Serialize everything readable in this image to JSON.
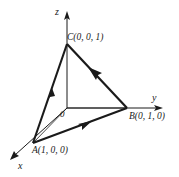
{
  "figure": {
    "stroke_color": "#1a1a1a",
    "background_color": "#ffffff",
    "axes": [
      {
        "name": "z",
        "label": "z",
        "from": [
          67,
          108
        ],
        "to": [
          67,
          14
        ],
        "arrow": "up"
      },
      {
        "name": "y",
        "label": "y",
        "from": [
          67,
          108
        ],
        "to": [
          162,
          108
        ],
        "arrow": "right"
      },
      {
        "name": "x",
        "label": "x",
        "from": [
          67,
          108
        ],
        "to": [
          11,
          159
        ],
        "arrow": "down-left"
      }
    ],
    "origin": {
      "label": "0",
      "position": [
        67,
        108
      ]
    },
    "points": [
      {
        "name": "A",
        "label": "A(1, 0, 0)",
        "position": [
          33,
          143
        ]
      },
      {
        "name": "B",
        "label": "B(0, 1, 0)",
        "position": [
          127,
          108
        ]
      },
      {
        "name": "C",
        "label": "C(0, 0, 1)",
        "position": [
          67,
          44
        ]
      }
    ],
    "edges": [
      {
        "name": "edge-a-to-c",
        "from": "A",
        "to": "C",
        "style": "thick",
        "arrow_at_midpoint": true,
        "arrow_direction": "toward-C"
      },
      {
        "name": "edge-c-to-b",
        "from": "C",
        "to": "B",
        "style": "thick",
        "arrow_at_midpoint": true,
        "arrow_direction": "toward-C"
      },
      {
        "name": "edge-a-to-b",
        "from": "A",
        "to": "B",
        "style": "thick",
        "arrow_at_midpoint": true,
        "arrow_direction": "toward-B"
      }
    ],
    "projection_lines": [
      {
        "name": "line-origin-to-a",
        "from": "origin",
        "to": "A",
        "style": "thin"
      },
      {
        "name": "line-origin-to-b",
        "from": "origin",
        "to": "B",
        "style": "thin"
      }
    ]
  }
}
